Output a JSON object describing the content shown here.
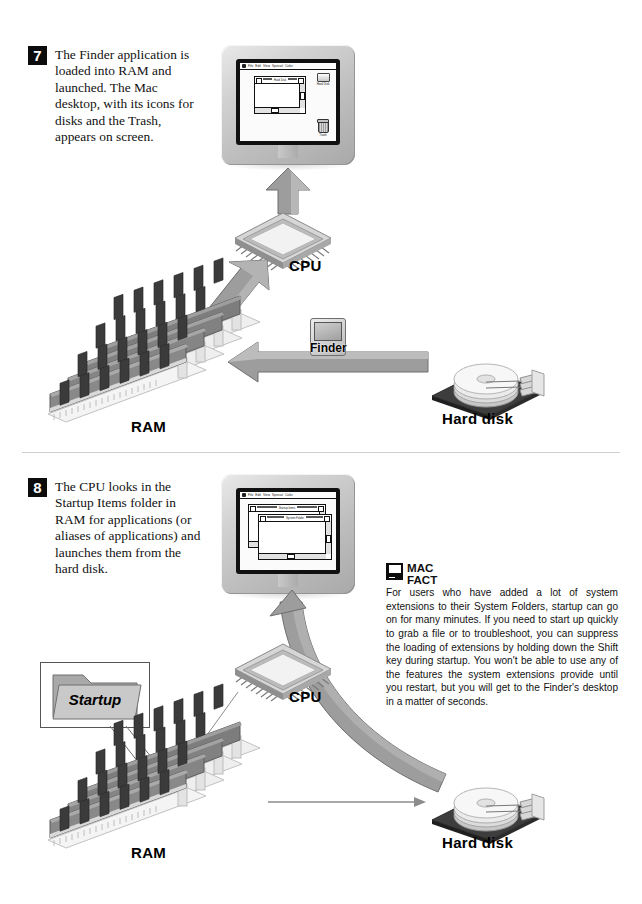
{
  "document": {
    "title": "Macintosh Startup Sequence — Steps 7 and 8",
    "step_badge_color": "#0c0c0c"
  },
  "steps": [
    {
      "number": "7",
      "text": "The Finder application is loaded into RAM and launched. The Mac desktop, with its icons for disks and the Trash, appears on screen."
    },
    {
      "number": "8",
      "text": "The CPU looks in the Startup Items folder in RAM for applications (or aliases of applications) and launches them from the hard disk."
    }
  ],
  "labels": {
    "cpu": "CPU",
    "ram": "RAM",
    "hard_disk": "Hard disk",
    "finder": "Finder",
    "startup_folder": "Startup"
  },
  "desktop": {
    "menu_items": [
      "File",
      "Edit",
      "View",
      "Special",
      "Color"
    ],
    "apple_menu": "apple-menu",
    "window_title_top": "Hard Disk",
    "window_title_mid": "Startup Items",
    "window_title_front": "System Folder",
    "icons": [
      {
        "name": "Hard Disk",
        "glyph": "hard-disk-icon"
      },
      {
        "name": "Trash",
        "glyph": "trash-icon"
      }
    ]
  },
  "mac_fact": {
    "heading_line1": "MAC",
    "heading_line2": "FACT",
    "icon": "mac-computer-icon",
    "body": "For users who have added a lot of system extensions to their System Folders, startup can go on for many minutes. If you need to start up quickly to grab a file or to troubleshoot, you can suppress the loading of extensions by holding down the Shift key during startup. You won't be able to use any of the features the system extensions provide until you restart, but you will get to the Finder's desktop in a matter of seconds."
  },
  "colors": {
    "arrow_gray": "#9a9a9a",
    "arrow_dark": "#6e6e6e",
    "chip_dark": "#4a4a4a",
    "board_dark": "#3a3a3a",
    "text": "#111111"
  }
}
